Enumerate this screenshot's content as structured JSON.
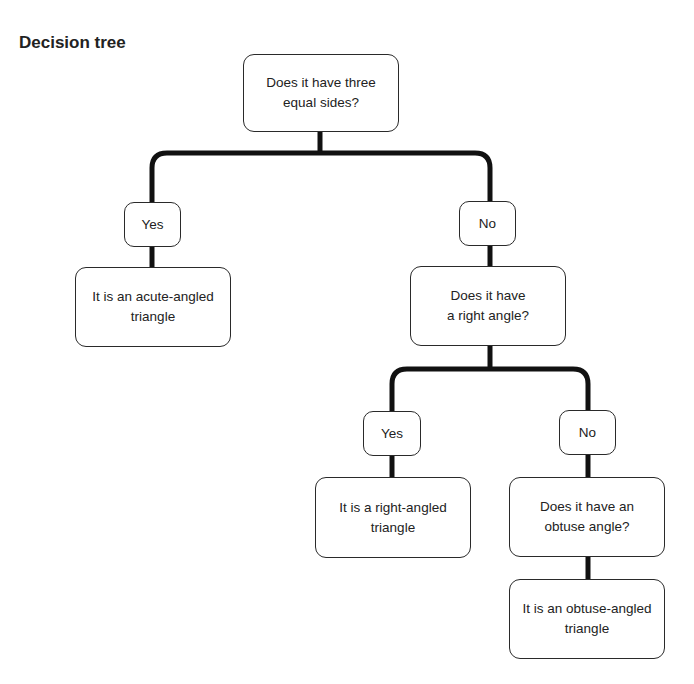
{
  "title": "Decision tree",
  "nodes": {
    "q_equal_sides": "Does it have three\nequal sides?",
    "branch1_yes": "Yes",
    "branch1_no": "No",
    "a_acute": "It is an acute-angled\ntriangle",
    "q_right_angle": "Does it have\na right angle?",
    "branch2_yes": "Yes",
    "branch2_no": "No",
    "a_right": "It is a right-angled\ntriangle",
    "q_obtuse": "Does it have an\nobtuse angle?",
    "a_obtuse": "It is an obtuse-angled\ntriangle"
  },
  "colors": {
    "line": "#111111",
    "border": "#2a2a2a",
    "text": "#222222"
  }
}
